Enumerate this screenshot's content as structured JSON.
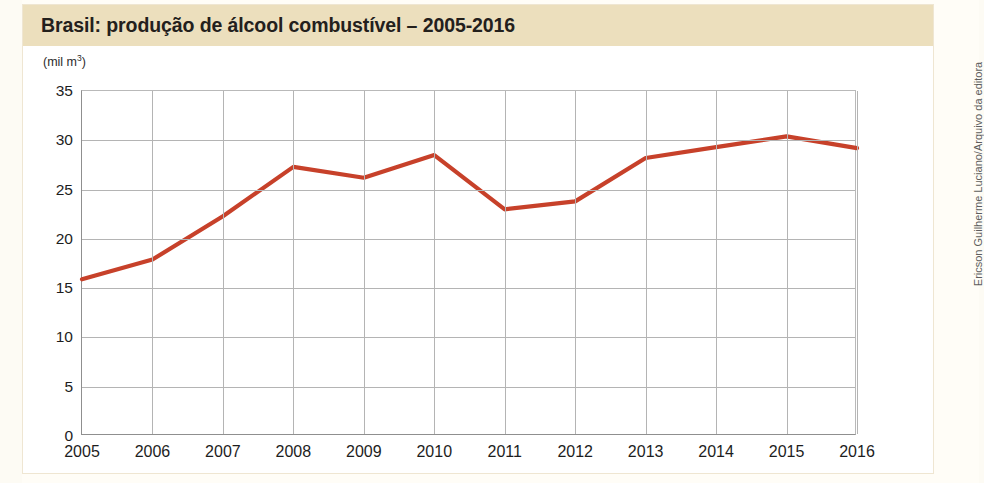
{
  "credit": {
    "text": "Ericson Guilherme Luciano/Arquivo da editora"
  },
  "left_margin": {
    "partial_text": "ca do ::"
  },
  "chart_data": {
    "type": "line",
    "title": "Brasil: produção de álcool combustível – 2005-2016",
    "unit_label": "(mil m",
    "unit_exponent": "3",
    "unit_suffix": ")",
    "xlabel": "",
    "ylabel": "(mil m³)",
    "categories": [
      "2005",
      "2006",
      "2007",
      "2008",
      "2009",
      "2010",
      "2011",
      "2012",
      "2013",
      "2014",
      "2015",
      "2016"
    ],
    "values": [
      15.9,
      17.9,
      22.3,
      27.3,
      26.2,
      28.5,
      23.0,
      23.8,
      28.2,
      29.3,
      30.4,
      29.2
    ],
    "ylim": [
      0,
      35
    ],
    "yticks": [
      "0",
      "5",
      "10",
      "15",
      "20",
      "25",
      "30",
      "35"
    ],
    "ytick_values": [
      0,
      5,
      10,
      15,
      20,
      25,
      30,
      35
    ],
    "grid": true,
    "legend": "none",
    "series_color": "#c7412a",
    "title_bar_color": "#ecdfbd",
    "grid_color": "#b4b4b4",
    "axis_color": "#8f8f8f",
    "plot_background": "#ffffff"
  }
}
